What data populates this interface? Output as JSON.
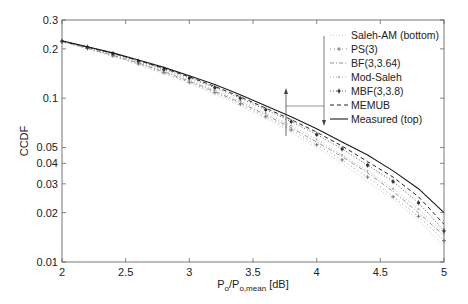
{
  "chart_data": {
    "type": "line",
    "title": "",
    "xlabel": "P_o/P_o,mean [dB]",
    "xlabel_parts": {
      "main1": "P",
      "sub1": "o",
      "main2": "/P",
      "sub2": "o,mean",
      "unit": " [dB]"
    },
    "ylabel": "CCDF",
    "xlim": [
      2,
      5
    ],
    "ylim": [
      0.01,
      0.3
    ],
    "yscale": "log",
    "x_ticks": [
      2,
      2.5,
      3,
      3.5,
      4,
      4.5,
      5
    ],
    "x_tick_labels": [
      "2",
      "2.5",
      "3",
      "3.5",
      "4",
      "4.5",
      "5"
    ],
    "y_ticks": [
      0.01,
      0.02,
      0.03,
      0.04,
      0.05,
      0.1,
      0.2,
      0.3
    ],
    "y_tick_labels": [
      "0.01",
      "0.02",
      "0.03",
      "0.04",
      "0.05",
      "0.1",
      "0.2",
      "0.3"
    ],
    "grid": false,
    "legend_position": "upper right",
    "x": [
      2.0,
      2.2,
      2.4,
      2.6,
      2.8,
      3.0,
      3.2,
      3.4,
      3.6,
      3.8,
      4.0,
      4.2,
      4.4,
      4.6,
      4.8,
      5.0
    ],
    "series": [
      {
        "name": "Saleh-AM (bottom)",
        "style": "dotted-light",
        "values": [
          0.22,
          0.2,
          0.18,
          0.16,
          0.141,
          0.123,
          0.106,
          0.09,
          0.075,
          0.062,
          0.05,
          0.04,
          0.031,
          0.024,
          0.018,
          0.0125
        ]
      },
      {
        "name": "PS(3)",
        "style": "plus-marker",
        "values": [
          0.221,
          0.201,
          0.181,
          0.162,
          0.143,
          0.125,
          0.108,
          0.092,
          0.077,
          0.064,
          0.052,
          0.042,
          0.033,
          0.025,
          0.019,
          0.0135
        ]
      },
      {
        "name": "BF(3,3.64)",
        "style": "dashdot",
        "values": [
          0.222,
          0.202,
          0.183,
          0.164,
          0.145,
          0.127,
          0.11,
          0.094,
          0.079,
          0.066,
          0.054,
          0.044,
          0.035,
          0.027,
          0.02,
          0.0145
        ]
      },
      {
        "name": "Mod-Saleh",
        "style": "dot-marker",
        "values": [
          0.222,
          0.203,
          0.184,
          0.165,
          0.147,
          0.129,
          0.112,
          0.096,
          0.081,
          0.068,
          0.056,
          0.045,
          0.036,
          0.028,
          0.021,
          0.015
        ]
      },
      {
        "name": "MBF(3,3.8)",
        "style": "star-marker",
        "values": [
          0.223,
          0.205,
          0.187,
          0.168,
          0.15,
          0.133,
          0.116,
          0.1,
          0.085,
          0.072,
          0.06,
          0.049,
          0.039,
          0.031,
          0.023,
          0.0155
        ]
      },
      {
        "name": "MEMUB",
        "style": "dashed",
        "values": [
          0.223,
          0.205,
          0.188,
          0.17,
          0.152,
          0.135,
          0.118,
          0.102,
          0.087,
          0.074,
          0.062,
          0.051,
          0.041,
          0.033,
          0.025,
          0.017
        ]
      },
      {
        "name": "Measured (top)",
        "style": "solid",
        "values": [
          0.224,
          0.206,
          0.189,
          0.171,
          0.154,
          0.137,
          0.121,
          0.105,
          0.09,
          0.077,
          0.065,
          0.054,
          0.045,
          0.036,
          0.028,
          0.02
        ]
      }
    ],
    "annotations": [
      {
        "type": "arrow",
        "description": "double-headed vertical arrow at x~3.75 spanning curves, linked to legend bracket"
      }
    ]
  },
  "colors": {
    "axis": "#555555",
    "text": "#222222",
    "measured": "#1a1a1a",
    "memub": "#222222",
    "mbf": "#333333",
    "mod_saleh": "#888888",
    "bf": "#777777",
    "ps": "#555555",
    "saleh": "#bbbbbb"
  }
}
